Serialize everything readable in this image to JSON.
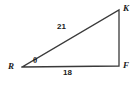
{
  "figure": {
    "kind": "geometry-diagram",
    "shape": "right-triangle",
    "background_color": "#ffffff",
    "stroke_color": "#3a3a3a"
  },
  "vertices": [
    {
      "id": "R",
      "label": "R",
      "x": 22,
      "y": 67,
      "role": "angle-theta-vertex"
    },
    {
      "id": "F",
      "label": "F",
      "x": 119,
      "y": 66,
      "role": "right-angle-vertex"
    },
    {
      "id": "K",
      "label": "K",
      "x": 119,
      "y": 10,
      "role": "apex"
    }
  ],
  "sides": [
    {
      "id": "RK",
      "name": "hypotenuse",
      "label": "21",
      "from": "R",
      "to": "K",
      "labeled": true
    },
    {
      "id": "RF",
      "name": "base",
      "label": "18",
      "from": "R",
      "to": "F",
      "labeled": true
    },
    {
      "id": "FK",
      "name": "vertical-leg",
      "label": "",
      "from": "F",
      "to": "K",
      "labeled": false
    }
  ],
  "angles": [
    {
      "id": "theta",
      "label": "θ",
      "at_vertex": "R"
    }
  ]
}
